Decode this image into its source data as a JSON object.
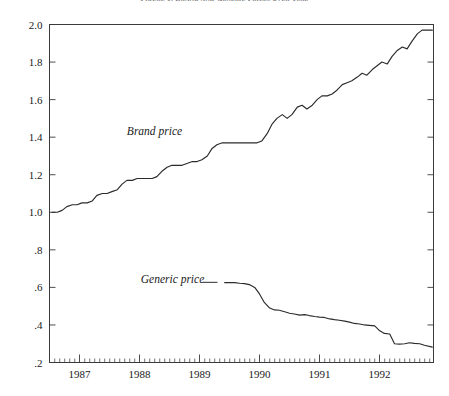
{
  "chart_data": {
    "type": "line",
    "title": "Figure 1. Brand and Generic Prices over Time",
    "xlabel": "",
    "ylabel": "",
    "xlim": [
      1986.5,
      1992.9
    ],
    "ylim": [
      0.2,
      2.0
    ],
    "grid": false,
    "legend_position": "inline-annotation",
    "y_ticks": [
      "2.0",
      "1.8",
      "1.6",
      "1.4",
      "1.2",
      "1.0",
      ".8",
      ".6",
      ".4",
      ".2"
    ],
    "y_tick_values": [
      2.0,
      1.8,
      1.6,
      1.4,
      1.2,
      1.0,
      0.8,
      0.6,
      0.4,
      0.2
    ],
    "x_ticks": [
      "1987",
      "1988",
      "1989",
      "1990",
      "1991",
      "1992"
    ],
    "x_tick_values": [
      1987,
      1988,
      1989,
      1990,
      1991,
      1992
    ],
    "x_minor_tick_interval": 0.08333,
    "annotations": [
      {
        "text": "Brand price",
        "x": 1988.25,
        "y": 1.41
      },
      {
        "text": "Generic price",
        "x": 1988.55,
        "y": 0.625
      }
    ],
    "series": [
      {
        "name": "Brand price",
        "x": [
          1986.54,
          1986.63,
          1986.71,
          1986.79,
          1986.88,
          1986.96,
          1987.04,
          1987.13,
          1987.21,
          1987.29,
          1987.38,
          1987.46,
          1987.54,
          1987.63,
          1987.71,
          1987.79,
          1987.88,
          1987.96,
          1988.04,
          1988.13,
          1988.21,
          1988.29,
          1988.38,
          1988.46,
          1988.54,
          1988.63,
          1988.71,
          1988.79,
          1988.88,
          1988.96,
          1989.04,
          1989.13,
          1989.21,
          1989.29,
          1989.38,
          1989.46,
          1989.54,
          1989.63,
          1989.71,
          1989.79,
          1989.88,
          1989.96,
          1990.04,
          1990.13,
          1990.21,
          1990.29,
          1990.38,
          1990.46,
          1990.54,
          1990.63,
          1990.71,
          1990.79,
          1990.88,
          1990.96,
          1991.04,
          1991.13,
          1991.21,
          1991.29,
          1991.38,
          1991.46,
          1991.54,
          1991.63,
          1991.71,
          1991.79,
          1991.88,
          1991.96,
          1992.04,
          1992.13,
          1992.21,
          1992.29,
          1992.38,
          1992.46,
          1992.54,
          1992.63,
          1992.71,
          1992.79,
          1992.88
        ],
        "values": [
          1.0,
          1.0,
          1.01,
          1.03,
          1.04,
          1.04,
          1.05,
          1.05,
          1.06,
          1.09,
          1.1,
          1.1,
          1.11,
          1.12,
          1.15,
          1.17,
          1.17,
          1.18,
          1.18,
          1.18,
          1.18,
          1.19,
          1.22,
          1.24,
          1.25,
          1.25,
          1.25,
          1.26,
          1.27,
          1.27,
          1.28,
          1.3,
          1.34,
          1.36,
          1.37,
          1.37,
          1.37,
          1.37,
          1.37,
          1.37,
          1.37,
          1.37,
          1.38,
          1.42,
          1.47,
          1.5,
          1.52,
          1.5,
          1.52,
          1.56,
          1.57,
          1.55,
          1.57,
          1.6,
          1.62,
          1.62,
          1.63,
          1.65,
          1.68,
          1.69,
          1.7,
          1.72,
          1.74,
          1.73,
          1.76,
          1.78,
          1.8,
          1.79,
          1.83,
          1.86,
          1.88,
          1.87,
          1.91,
          1.95,
          1.97,
          1.97,
          1.97
        ]
      },
      {
        "name": "Generic price",
        "x": [
          1989.42,
          1989.5,
          1989.58,
          1989.67,
          1989.75,
          1989.83,
          1989.92,
          1990.0,
          1990.08,
          1990.17,
          1990.25,
          1990.33,
          1990.42,
          1990.5,
          1990.58,
          1990.67,
          1990.75,
          1990.83,
          1990.92,
          1991.0,
          1991.08,
          1991.17,
          1991.25,
          1991.33,
          1991.42,
          1991.5,
          1991.58,
          1991.67,
          1991.75,
          1991.83,
          1991.92,
          1992.0,
          1992.08,
          1992.17,
          1992.25,
          1992.33,
          1992.42,
          1992.5,
          1992.58,
          1992.67,
          1992.75,
          1992.88
        ],
        "values": [
          0.625,
          0.625,
          0.625,
          0.622,
          0.62,
          0.615,
          0.6,
          0.565,
          0.52,
          0.49,
          0.48,
          0.478,
          0.47,
          0.462,
          0.458,
          0.452,
          0.455,
          0.45,
          0.445,
          0.442,
          0.44,
          0.432,
          0.428,
          0.425,
          0.42,
          0.415,
          0.408,
          0.405,
          0.4,
          0.398,
          0.395,
          0.37,
          0.355,
          0.352,
          0.3,
          0.298,
          0.3,
          0.305,
          0.302,
          0.3,
          0.292,
          0.282
        ]
      }
    ]
  }
}
